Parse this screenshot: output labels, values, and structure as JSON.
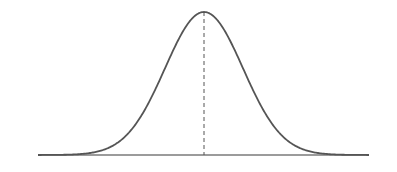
{
  "diagram": {
    "type": "normal-distribution-curve",
    "curve": {
      "center_x": 204,
      "peak_y": 12,
      "baseline_y": 155,
      "sigma_px": 39,
      "stroke": "#555555",
      "stroke_width": 1.8
    },
    "baseline": {
      "x1": 38,
      "x2": 369,
      "y": 155,
      "stroke": "#7a7a7a",
      "stroke_width": 1.4
    },
    "mean_line": {
      "x": 204,
      "y1": 12,
      "y2": 155,
      "stroke": "#555555",
      "dash": "4,3"
    },
    "background": "#ffffff"
  }
}
